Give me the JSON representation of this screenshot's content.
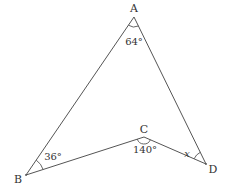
{
  "diagram": {
    "type": "geometry-figure",
    "line_color": "#555555",
    "vertices": [
      {
        "name": "A",
        "x": 134,
        "y": 17
      },
      {
        "name": "B",
        "x": 26,
        "y": 175
      },
      {
        "name": "C",
        "x": 144,
        "y": 137
      },
      {
        "name": "D",
        "x": 206,
        "y": 164
      }
    ],
    "segments": [
      [
        "A",
        "B"
      ],
      [
        "B",
        "C"
      ],
      [
        "C",
        "D"
      ],
      [
        "D",
        "A"
      ]
    ],
    "labels": {
      "A": "A",
      "B": "B",
      "C": "C",
      "D": "D"
    },
    "angles": {
      "A": "64°",
      "B": "36°",
      "C": "140°",
      "D": "x"
    }
  }
}
